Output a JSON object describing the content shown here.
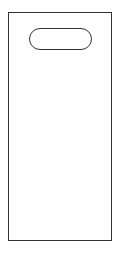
{
  "figure": {
    "stroke_color": "#333333",
    "fill_color": "#ffffff",
    "background_color": "#ffffff",
    "bag": {
      "shape": "rectangle",
      "x": 8,
      "y": 12,
      "width": 103,
      "height": 228
    },
    "handle_slot": {
      "shape": "stadium",
      "x": 29,
      "y": 28,
      "width": 63,
      "height": 22
    }
  }
}
